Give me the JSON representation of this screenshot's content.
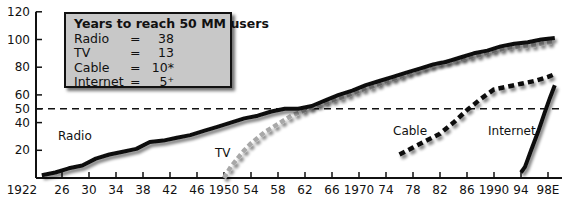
{
  "chart_data": {
    "type": "line",
    "title": "Years to reach 50 MM users",
    "xlabel": "",
    "ylabel": "",
    "ylim": [
      0,
      120
    ],
    "yticks": [
      20,
      40,
      50,
      60,
      80,
      100,
      120
    ],
    "xticks": [
      "1922",
      "26",
      "30",
      "34",
      "38",
      "42",
      "46",
      "1950",
      "54",
      "58",
      "62",
      "66",
      "1970",
      "74",
      "78",
      "82",
      "86",
      "1990",
      "94",
      "98E"
    ],
    "xtick_years": [
      1922,
      1926,
      1930,
      1934,
      1938,
      1942,
      1946,
      1950,
      1954,
      1958,
      1962,
      1966,
      1970,
      1974,
      1978,
      1982,
      1986,
      1990,
      1994,
      1998
    ],
    "reference_line": {
      "y": 50,
      "style": "dashed"
    },
    "grid": false,
    "legend_box": {
      "title": "Years to reach 50 MM users",
      "entries": [
        {
          "name": "Radio",
          "eq": "=",
          "value": "38"
        },
        {
          "name": "TV",
          "eq": "=",
          "value": "13"
        },
        {
          "name": "Cable",
          "eq": "=",
          "value": "10*"
        },
        {
          "name": "Internet",
          "eq": "=",
          "value": "5⁺"
        }
      ]
    },
    "series": [
      {
        "name": "Radio",
        "style": "solid-black",
        "label_pos": {
          "x": 58,
          "y": 140
        },
        "x": [
          1923,
          1925,
          1927,
          1929,
          1931,
          1933,
          1935,
          1937,
          1939,
          1941,
          1943,
          1945,
          1947,
          1949,
          1951,
          1953,
          1955,
          1957,
          1959,
          1961,
          1963,
          1965,
          1967,
          1969,
          1971,
          1973,
          1975,
          1977,
          1979,
          1981,
          1983,
          1985,
          1987,
          1989,
          1991,
          1993,
          1995,
          1997,
          1999
        ],
        "values": [
          2,
          4,
          7,
          9,
          14,
          17,
          19,
          21,
          26,
          27,
          29,
          31,
          34,
          37,
          40,
          43,
          45,
          48,
          50,
          50,
          52,
          56,
          60,
          63,
          67,
          70,
          73,
          76,
          79,
          82,
          84,
          87,
          90,
          92,
          95,
          97,
          98,
          100,
          101
        ]
      },
      {
        "name": "TV",
        "style": "gray-dashed",
        "label_pos": {
          "x": 215,
          "y": 157
        },
        "x": [
          1950,
          1951,
          1952,
          1953,
          1954,
          1956,
          1958,
          1960,
          1962,
          1964,
          1966,
          1968,
          1970,
          1972,
          1974,
          1976,
          1978,
          1980,
          1982,
          1984,
          1986,
          1988,
          1990,
          1992,
          1994,
          1996,
          1998,
          1999
        ],
        "values": [
          0,
          8,
          14,
          20,
          25,
          33,
          39,
          45,
          49,
          53,
          56,
          59,
          63,
          66,
          70,
          73,
          77,
          80,
          83,
          85,
          87,
          89,
          92,
          94,
          95,
          96,
          98,
          98
        ]
      },
      {
        "name": "Cable",
        "style": "black-dashed",
        "label_pos": {
          "x": 393,
          "y": 135
        },
        "x": [
          1976,
          1978,
          1980,
          1982,
          1984,
          1986,
          1988,
          1990,
          1992,
          1994,
          1996,
          1998,
          1999
        ],
        "values": [
          17,
          22,
          27,
          32,
          40,
          49,
          57,
          64,
          66,
          68,
          70,
          73,
          75
        ]
      },
      {
        "name": "Internet",
        "style": "solid-black",
        "label_pos": {
          "x": 488,
          "y": 135
        },
        "x": [
          1994,
          1994.6,
          1995.5,
          1996.5,
          1997.5,
          1998.3,
          1999
        ],
        "values": [
          4,
          8,
          20,
          33,
          47,
          58,
          67
        ]
      }
    ]
  }
}
